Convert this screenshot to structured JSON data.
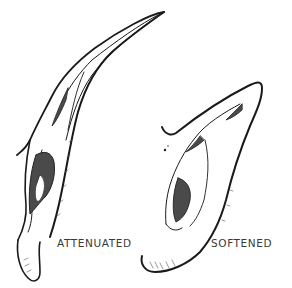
{
  "illustration": {
    "ears": [
      {
        "id": "left",
        "label": "ATTENUATED"
      },
      {
        "id": "right",
        "label": "SOFTENED"
      }
    ],
    "colors": {
      "ink": "#1a1a1a",
      "shade": "#555555",
      "label": "#3a3a3a",
      "background": "#ffffff"
    }
  }
}
